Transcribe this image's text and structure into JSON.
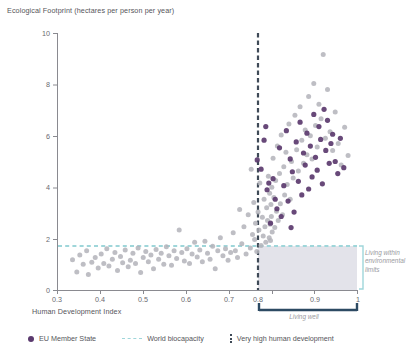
{
  "chart_data": {
    "type": "scatter",
    "title": "Ecological Footprint (hectares per person per year)",
    "xlabel": "Human Development Index",
    "ylabel": "Ecological Footprint (hectares per person per year)",
    "xlim": [
      0.3,
      1.0
    ],
    "ylim": [
      0,
      10
    ],
    "xticks": [
      "0.3",
      "0.4",
      "0.5",
      "0.6",
      "0.7",
      "0.8",
      "0.9",
      "1"
    ],
    "xtick_values": [
      0.3,
      0.4,
      0.5,
      0.6,
      0.7,
      0.8,
      0.9,
      1.0
    ],
    "yticks": [
      "0",
      "2",
      "4",
      "6",
      "8",
      "10"
    ],
    "ytick_values": [
      0,
      2,
      4,
      6,
      8,
      10
    ],
    "grid": false,
    "legend_position": "bottom",
    "colors": {
      "eu_member_state": "#5b3a6e",
      "other_country": "#b3b3ba",
      "world_biocapacity": "#9fd6da",
      "very_high_human_development": "#3f4a57",
      "living_well_bracket": "#2d4a63",
      "shaded_region": "#d8d8e2"
    },
    "reference_lines": [
      {
        "name": "World biocapacity",
        "orientation": "horizontal",
        "value": 1.7,
        "style": "dashed",
        "color": "#9fd6da"
      },
      {
        "name": "Very high human development",
        "orientation": "vertical",
        "value": 0.8,
        "style": "dashed",
        "color": "#3f4a57"
      }
    ],
    "shaded_region": {
      "label": "Living within environmental limits",
      "x_range": [
        0.8,
        1.0
      ],
      "y_range": [
        0,
        1.7
      ]
    },
    "annotations": [
      {
        "text": "Living within environmental limits",
        "position": "right"
      },
      {
        "text": "Living well",
        "position": "bottom"
      }
    ],
    "series": [
      {
        "name": "Other country",
        "color": "#b3b3ba",
        "points": [
          [
            0.335,
            1.2
          ],
          [
            0.345,
            0.72
          ],
          [
            0.352,
            1.38
          ],
          [
            0.36,
            1.02
          ],
          [
            0.368,
            1.55
          ],
          [
            0.372,
            0.62
          ],
          [
            0.38,
            1.1
          ],
          [
            0.388,
            1.28
          ],
          [
            0.395,
            0.88
          ],
          [
            0.402,
            1.42
          ],
          [
            0.408,
            1.05
          ],
          [
            0.415,
            1.62
          ],
          [
            0.42,
            0.95
          ],
          [
            0.428,
            1.22
          ],
          [
            0.434,
            1.48
          ],
          [
            0.44,
            0.78
          ],
          [
            0.447,
            1.32
          ],
          [
            0.452,
            1.08
          ],
          [
            0.458,
            1.58
          ],
          [
            0.465,
            0.92
          ],
          [
            0.47,
            1.18
          ],
          [
            0.476,
            1.45
          ],
          [
            0.482,
            1.05
          ],
          [
            0.488,
            1.65
          ],
          [
            0.494,
            0.7
          ],
          [
            0.5,
            1.28
          ],
          [
            0.506,
            1.52
          ],
          [
            0.512,
            1.12
          ],
          [
            0.518,
            1.38
          ],
          [
            0.524,
            0.85
          ],
          [
            0.53,
            1.6
          ],
          [
            0.536,
            1.22
          ],
          [
            0.542,
            1.45
          ],
          [
            0.548,
            1.02
          ],
          [
            0.554,
            1.7
          ],
          [
            0.56,
            1.35
          ],
          [
            0.566,
            0.98
          ],
          [
            0.572,
            1.55
          ],
          [
            0.578,
            1.25
          ],
          [
            0.584,
            2.35
          ],
          [
            0.59,
            1.48
          ],
          [
            0.596,
            1.15
          ],
          [
            0.602,
            1.62
          ],
          [
            0.608,
            1.05
          ],
          [
            0.614,
            1.42
          ],
          [
            0.62,
            1.88
          ],
          [
            0.626,
            1.3
          ],
          [
            0.632,
            1.58
          ],
          [
            0.638,
            1.12
          ],
          [
            0.644,
            1.92
          ],
          [
            0.65,
            1.45
          ],
          [
            0.656,
            1.22
          ],
          [
            0.662,
            1.72
          ],
          [
            0.668,
            0.85
          ],
          [
            0.674,
            1.55
          ],
          [
            0.68,
            2.05
          ],
          [
            0.686,
            1.35
          ],
          [
            0.692,
            1.62
          ],
          [
            0.698,
            1.18
          ],
          [
            0.704,
            1.48
          ],
          [
            0.71,
            2.25
          ],
          [
            0.715,
            1.55
          ],
          [
            0.72,
            1.28
          ],
          [
            0.725,
            3.15
          ],
          [
            0.73,
            1.82
          ],
          [
            0.735,
            2.48
          ],
          [
            0.74,
            1.42
          ],
          [
            0.745,
            2.95
          ],
          [
            0.75,
            1.65
          ],
          [
            0.752,
            4.72
          ],
          [
            0.755,
            2.18
          ],
          [
            0.758,
            3.42
          ],
          [
            0.76,
            1.98
          ],
          [
            0.762,
            2.62
          ],
          [
            0.765,
            1.52
          ],
          [
            0.768,
            3.05
          ],
          [
            0.77,
            2.35
          ],
          [
            0.772,
            4.18
          ],
          [
            0.775,
            1.75
          ],
          [
            0.778,
            2.85
          ],
          [
            0.78,
            2.12
          ],
          [
            0.782,
            3.55
          ],
          [
            0.784,
            2.48
          ],
          [
            0.786,
            1.88
          ],
          [
            0.788,
            3.22
          ],
          [
            0.79,
            2.72
          ],
          [
            0.792,
            4.45
          ],
          [
            0.794,
            2.05
          ],
          [
            0.795,
            3.78
          ],
          [
            0.796,
            2.58
          ],
          [
            0.797,
            1.95
          ],
          [
            0.798,
            3.35
          ],
          [
            0.799,
            2.88
          ],
          [
            0.8,
            4.02
          ],
          [
            0.801,
            2.28
          ],
          [
            0.803,
            5.15
          ],
          [
            0.805,
            3.62
          ],
          [
            0.807,
            2.45
          ],
          [
            0.809,
            4.28
          ],
          [
            0.811,
            3.08
          ],
          [
            0.813,
            5.62
          ],
          [
            0.815,
            2.72
          ],
          [
            0.818,
            4.55
          ],
          [
            0.82,
            3.38
          ],
          [
            0.822,
            6.05
          ],
          [
            0.825,
            2.95
          ],
          [
            0.828,
            4.82
          ],
          [
            0.83,
            3.72
          ],
          [
            0.833,
            5.38
          ],
          [
            0.836,
            4.12
          ],
          [
            0.84,
            6.48
          ],
          [
            0.843,
            3.55
          ],
          [
            0.846,
            5.02
          ],
          [
            0.85,
            4.38
          ],
          [
            0.854,
            6.82
          ],
          [
            0.858,
            5.48
          ],
          [
            0.862,
            4.65
          ],
          [
            0.866,
            7.15
          ],
          [
            0.87,
            5.85
          ],
          [
            0.874,
            4.95
          ],
          [
            0.878,
            6.25
          ],
          [
            0.882,
            5.28
          ],
          [
            0.886,
            7.55
          ],
          [
            0.89,
            6.02
          ],
          [
            0.894,
            5.12
          ],
          [
            0.898,
            8.05
          ],
          [
            0.902,
            6.42
          ],
          [
            0.906,
            5.58
          ],
          [
            0.91,
            7.25
          ],
          [
            0.915,
            6.68
          ],
          [
            0.92,
            9.18
          ],
          [
            0.925,
            5.92
          ],
          [
            0.93,
            7.82
          ],
          [
            0.936,
            6.18
          ],
          [
            0.942,
            5.45
          ],
          [
            0.948,
            6.95
          ],
          [
            0.955,
            5.72
          ],
          [
            0.962,
            4.88
          ],
          [
            0.97,
            6.35
          ],
          [
            0.978,
            5.25
          ]
        ]
      },
      {
        "name": "EU Member State",
        "color": "#5b3a6e",
        "points": [
          [
            0.789,
            3.92
          ],
          [
            0.797,
            2.62
          ],
          [
            0.803,
            4.35
          ],
          [
            0.812,
            3.18
          ],
          [
            0.818,
            5.55
          ],
          [
            0.822,
            2.88
          ],
          [
            0.828,
            4.08
          ],
          [
            0.834,
            6.22
          ],
          [
            0.838,
            3.48
          ],
          [
            0.843,
            5.12
          ],
          [
            0.848,
            4.62
          ],
          [
            0.852,
            3.05
          ],
          [
            0.857,
            5.78
          ],
          [
            0.862,
            4.25
          ],
          [
            0.866,
            6.55
          ],
          [
            0.87,
            3.72
          ],
          [
            0.874,
            5.35
          ],
          [
            0.878,
            4.88
          ],
          [
            0.882,
            6.12
          ],
          [
            0.886,
            3.95
          ],
          [
            0.89,
            5.62
          ],
          [
            0.894,
            4.42
          ],
          [
            0.898,
            6.85
          ],
          [
            0.902,
            5.18
          ],
          [
            0.906,
            4.68
          ],
          [
            0.91,
            6.38
          ],
          [
            0.914,
            5.88
          ],
          [
            0.918,
            4.15
          ],
          [
            0.922,
            7.05
          ],
          [
            0.926,
            5.45
          ],
          [
            0.93,
            6.62
          ],
          [
            0.934,
            4.95
          ],
          [
            0.938,
            5.72
          ],
          [
            0.942,
            6.08
          ],
          [
            0.948,
            5.02
          ],
          [
            0.954,
            4.55
          ],
          [
            0.96,
            5.92
          ],
          [
            0.968,
            4.78
          ],
          [
            0.766,
            5.08
          ],
          [
            0.775,
            4.72
          ],
          [
            0.782,
            5.85
          ],
          [
            0.808,
            3.55
          ],
          [
            0.786,
            6.38
          ],
          [
            0.793,
            4.18
          ],
          [
            0.845,
            2.45
          ]
        ]
      }
    ]
  },
  "legend": {
    "items": [
      {
        "label": "EU Member State",
        "marker": "dot",
        "icon": "filled-circle-icon"
      },
      {
        "label": "World biocapacity",
        "marker": "dashed-line",
        "icon": "dashed-line-icon"
      },
      {
        "label": "Very high human development",
        "marker": "vertical-dashed-line",
        "icon": "vertical-dashed-line-icon"
      }
    ]
  },
  "annotations": {
    "living_within_limits": "Living within environmental limits",
    "living_well": "Living well"
  }
}
